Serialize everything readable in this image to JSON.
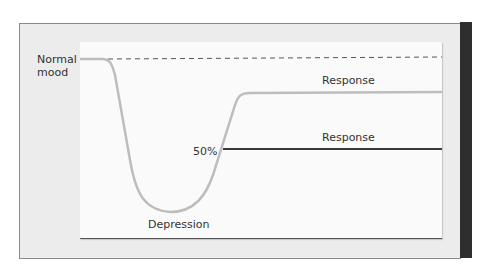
{
  "diagram": {
    "labels": {
      "normal_mood_line1": "Normal",
      "normal_mood_line2": "mood",
      "response_upper": "Response",
      "response_lower": "Response",
      "fifty_percent": "50%",
      "depression": "Depression"
    },
    "colors": {
      "mood_curve": "#bdbdbd",
      "baseline_dashed": "#555555",
      "response_line": "#3a3a3a",
      "panel_bg": "#ececec",
      "plot_bg": "#fafafa",
      "side_bar": "#2e2e2e"
    }
  }
}
